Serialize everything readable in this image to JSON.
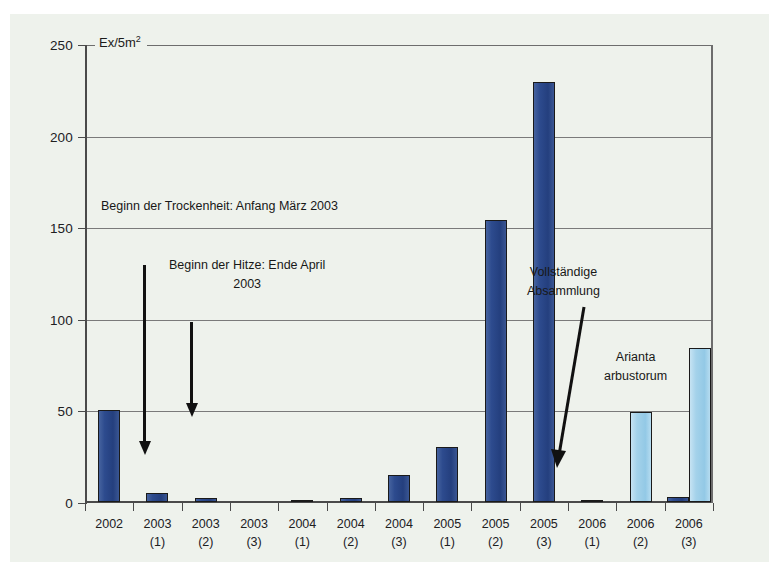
{
  "chart_data": {
    "type": "bar",
    "title": "",
    "subtitle": "",
    "xlabel": "",
    "ylabel": "Ex/5m",
    "ylabel_sup": "2",
    "ylim": [
      0,
      250
    ],
    "ytick_values": [
      0,
      50,
      100,
      150,
      200,
      250
    ],
    "ytick_labels": [
      "0",
      "50",
      "100",
      "150",
      "200",
      "250"
    ],
    "grid": "horizontal",
    "legend": "none",
    "categories": [
      {
        "year": "2002",
        "sub": ""
      },
      {
        "year": "2003",
        "sub": "(1)"
      },
      {
        "year": "2003",
        "sub": "(2)"
      },
      {
        "year": "2003",
        "sub": "(3)"
      },
      {
        "year": "2004",
        "sub": "(1)"
      },
      {
        "year": "2004",
        "sub": "(2)"
      },
      {
        "year": "2004",
        "sub": "(3)"
      },
      {
        "year": "2005",
        "sub": "(1)"
      },
      {
        "year": "2005",
        "sub": "(2)"
      },
      {
        "year": "2005",
        "sub": "(3)"
      },
      {
        "year": "2006",
        "sub": "(1)"
      },
      {
        "year": "2006",
        "sub": "(2)"
      },
      {
        "year": "2006",
        "sub": "(3)"
      }
    ],
    "series": [
      {
        "name": "Dark blue series",
        "color": "#2d4b8e",
        "values": [
          50,
          5,
          2,
          0,
          1,
          2,
          15,
          30,
          154,
          229,
          1,
          0,
          3
        ]
      },
      {
        "name": "Arianta arbustorum",
        "color": "#a4d2ea",
        "values": [
          0,
          0,
          0,
          0,
          0,
          0,
          0,
          0,
          0,
          0,
          0,
          49,
          84
        ]
      }
    ],
    "annotations": [
      {
        "id": "trockenheit",
        "text": "Beginn der Trockenheit: Anfang März 2003",
        "arrow": "down",
        "arrow_from_value": 128,
        "arrow_to_value": 28,
        "arrow_at_category": "2003 (1)"
      },
      {
        "id": "hitze",
        "text": "Beginn der Hitze: Ende April\n2003",
        "arrow": "down",
        "arrow_from_value": 97,
        "arrow_to_value": 45,
        "arrow_at_category": "2003 (2)"
      },
      {
        "id": "absammlung",
        "text": "Vollständige\nAbsammlung",
        "arrow": "diagonal",
        "arrow_to_category": "2006 (1)"
      },
      {
        "id": "arianta",
        "text": "Arianta\narbustorum",
        "arrow": "none"
      }
    ]
  },
  "colors": {
    "background": "#eef2ec",
    "axis": "#4a4a4a",
    "gridline": "#7a7a7a",
    "bar_dark": "#2d4b8e",
    "bar_light": "#a4d2ea",
    "text": "#20201f",
    "arrow": "#111111"
  }
}
